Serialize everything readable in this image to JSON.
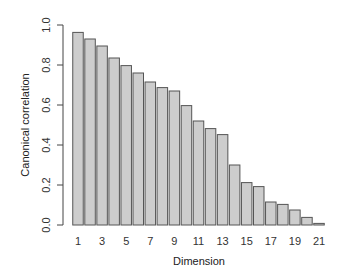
{
  "chart_data": {
    "type": "bar",
    "title": "",
    "xlabel": "Dimension",
    "ylabel": "Canonical correlation",
    "categories": [
      "1",
      "2",
      "3",
      "4",
      "5",
      "6",
      "7",
      "8",
      "9",
      "10",
      "11",
      "12",
      "13",
      "14",
      "15",
      "16",
      "17",
      "18",
      "19",
      "20",
      "21"
    ],
    "values": [
      0.963,
      0.93,
      0.895,
      0.835,
      0.797,
      0.76,
      0.715,
      0.687,
      0.67,
      0.597,
      0.52,
      0.482,
      0.452,
      0.3,
      0.212,
      0.192,
      0.115,
      0.103,
      0.075,
      0.038,
      0.008
    ],
    "x_tick_labels": [
      "1",
      "3",
      "5",
      "7",
      "9",
      "11",
      "13",
      "15",
      "17",
      "19",
      "21"
    ],
    "y_ticks": [
      0.0,
      0.2,
      0.4,
      0.6,
      0.8,
      1.0
    ],
    "y_tick_labels": [
      "0.0",
      "0.2",
      "0.4",
      "0.6",
      "0.8",
      "1.0"
    ],
    "ylim": [
      0,
      1.0
    ],
    "grid": false,
    "legend": null,
    "colors": {
      "bar_fill": "#cdcdcd",
      "bar_border": "#555555",
      "axis": "#444444"
    }
  }
}
